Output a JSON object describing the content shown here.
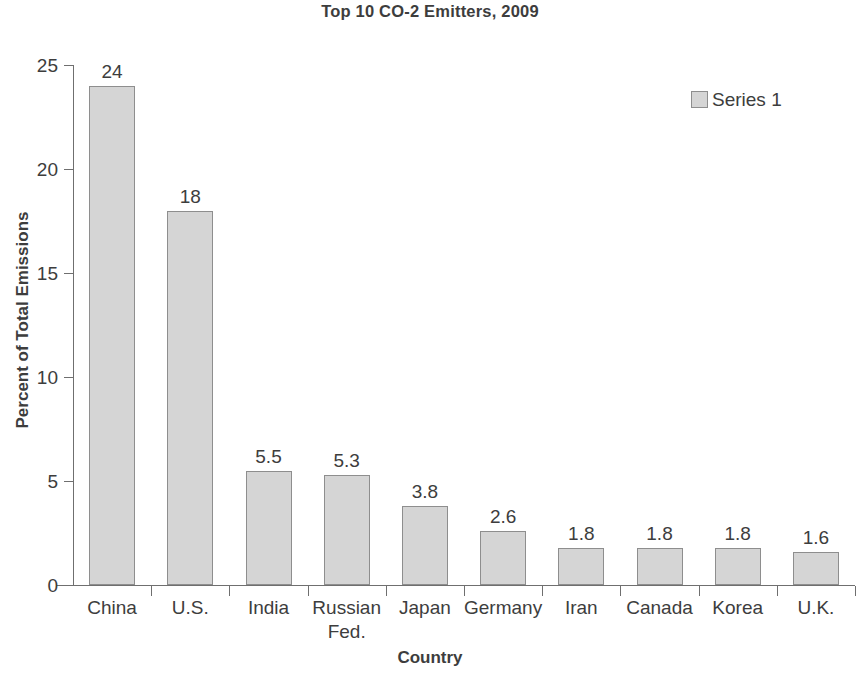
{
  "chart_data": {
    "type": "bar",
    "title": "Top 10 CO-2 Emitters, 2009",
    "xlabel": "Country",
    "ylabel": "Percent of Total Emissions",
    "categories": [
      "China",
      "U.S.",
      "India",
      "Russian Fed.",
      "Japan",
      "Germany",
      "Iran",
      "Canada",
      "Korea",
      "U.K."
    ],
    "category_lines": [
      [
        "China"
      ],
      [
        "U.S."
      ],
      [
        "India"
      ],
      [
        "Russian",
        "Fed."
      ],
      [
        "Japan"
      ],
      [
        "Germany"
      ],
      [
        "Iran"
      ],
      [
        "Canada"
      ],
      [
        "Korea"
      ],
      [
        "U.K."
      ]
    ],
    "values": [
      24,
      18,
      5.5,
      5.3,
      3.8,
      2.6,
      1.8,
      1.8,
      1.8,
      1.6
    ],
    "value_labels": [
      "24",
      "18",
      "5.5",
      "5.3",
      "3.8",
      "2.6",
      "1.8",
      "1.8",
      "1.8",
      "1.6"
    ],
    "series": [
      {
        "name": "Series 1",
        "values": [
          24,
          18,
          5.5,
          5.3,
          3.8,
          2.6,
          1.8,
          1.8,
          1.8,
          1.6
        ]
      }
    ],
    "ylim": [
      0,
      25
    ],
    "yticks": [
      0,
      5,
      10,
      15,
      20,
      25
    ],
    "ytick_labels": [
      "0",
      "5",
      "10",
      "15",
      "20",
      "25"
    ],
    "grid": false,
    "legend": {
      "position": "top-right",
      "entries": [
        "Series 1"
      ]
    },
    "colors": {
      "bar_fill": "#d5d5d5",
      "bar_border": "#8e8e8e",
      "axis": "#6f6f6f",
      "text": "#3d3d3d",
      "background": "#ffffff"
    }
  },
  "legend": {
    "series_1_label": "Series 1"
  }
}
